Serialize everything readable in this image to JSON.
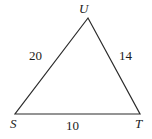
{
  "figure": {
    "type": "triangle-diagram",
    "stroke_color": "#2b2b2b",
    "text_color": "#1b1b1b",
    "background_color": "#ffffff",
    "stroke_width": 1.2,
    "vertices": [
      {
        "name": "U",
        "label": "U",
        "x": 88,
        "y": 18
      },
      {
        "name": "S",
        "label": "S",
        "x": 15,
        "y": 114
      },
      {
        "name": "T",
        "label": "T",
        "x": 140,
        "y": 114
      }
    ],
    "sides": [
      {
        "name": "SU",
        "label": "20",
        "from": "S",
        "to": "U"
      },
      {
        "name": "UT",
        "label": "14",
        "from": "U",
        "to": "T"
      },
      {
        "name": "ST",
        "label": "10",
        "from": "S",
        "to": "T"
      }
    ],
    "path_points": "88,18 15,114 140,114"
  }
}
